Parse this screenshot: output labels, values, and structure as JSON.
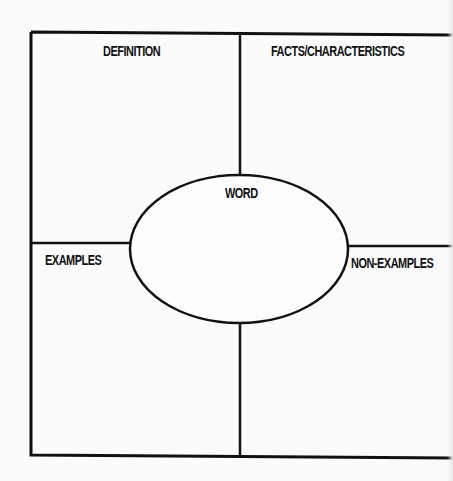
{
  "worksheet": {
    "type": "Frayer model graphic organizer",
    "center_label": "WORD",
    "quadrants": [
      {
        "position": "top-left",
        "label": "DEFINITION"
      },
      {
        "position": "top-right",
        "label": "FACTS/CHARACTERISTICS"
      },
      {
        "position": "bottom-left",
        "label": "EXAMPLES"
      },
      {
        "position": "bottom-right",
        "label": "NON-EXAMPLES"
      }
    ],
    "colors": {
      "background": "#fbfbfb",
      "lines": "#111111",
      "text": "#111111"
    }
  }
}
